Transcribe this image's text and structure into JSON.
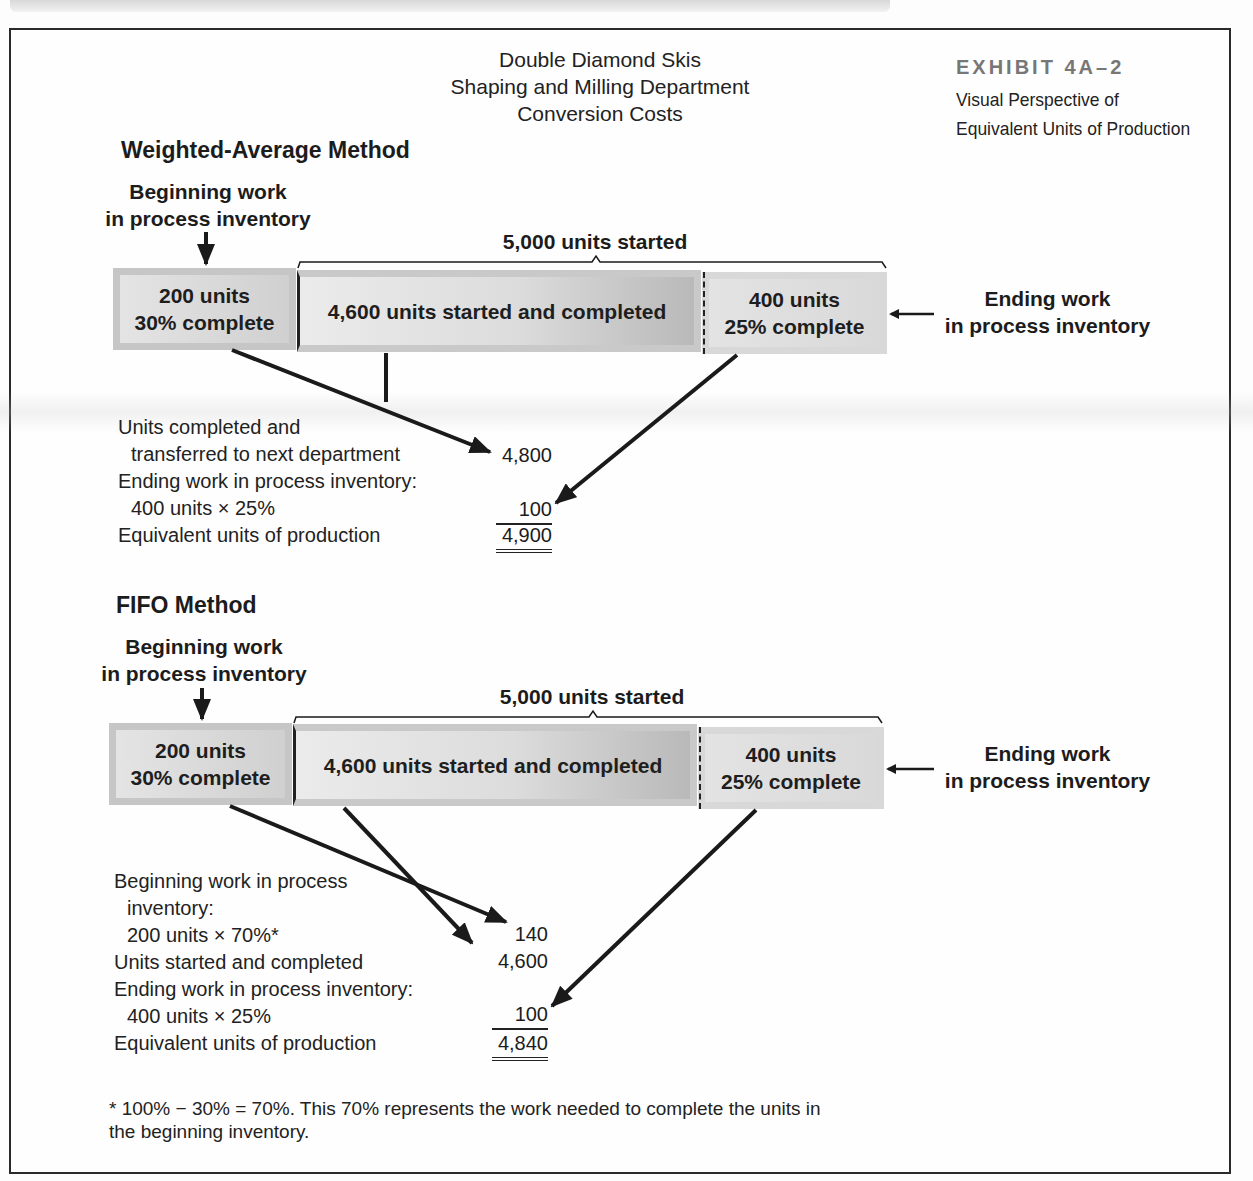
{
  "header": {
    "title_lines": [
      "Double Diamond Skis",
      "Shaping and Milling Department",
      "Conversion Costs"
    ],
    "exhibit_number": "EXHIBIT 4A–2",
    "exhibit_caption_lines": [
      "Visual Perspective of",
      "Equivalent Units of Production"
    ]
  },
  "weighted_average": {
    "title": "Weighted-Average Method",
    "beginning_label_lines": [
      "Beginning work",
      "in process inventory"
    ],
    "started_label": "5,000 units started",
    "ending_label_lines": [
      "Ending work",
      "in process inventory"
    ],
    "boxes": {
      "beginning": [
        "200 units",
        "30% complete"
      ],
      "started_completed": "4,600 units started and completed",
      "ending": [
        "400 units",
        "25% complete"
      ]
    },
    "calc_rows": [
      {
        "label": "Units completed and",
        "value": ""
      },
      {
        "label": "  transferred to next department",
        "value": "4,800"
      },
      {
        "label": "Ending work in process inventory:",
        "value": ""
      },
      {
        "label": "  400 units × 25%",
        "value": "100"
      },
      {
        "label": "Equivalent units of production",
        "value": "4,900"
      }
    ]
  },
  "fifo": {
    "title": "FIFO Method",
    "beginning_label_lines": [
      "Beginning work",
      "in process inventory"
    ],
    "started_label": "5,000 units started",
    "ending_label_lines": [
      "Ending work",
      "in process inventory"
    ],
    "boxes": {
      "beginning": [
        "200 units",
        "30% complete"
      ],
      "started_completed": "4,600 units started and completed",
      "ending": [
        "400 units",
        "25% complete"
      ]
    },
    "calc_rows": [
      {
        "label": "Beginning work in process",
        "value": ""
      },
      {
        "label": "  inventory:",
        "value": ""
      },
      {
        "label": "  200 units × 70%*",
        "value": "140"
      },
      {
        "label": "Units started and completed",
        "value": "4,600"
      },
      {
        "label": "Ending work in process inventory:",
        "value": ""
      },
      {
        "label": "  400 units × 25%",
        "value": "100"
      },
      {
        "label": "Equivalent units of production",
        "value": "4,840"
      }
    ]
  },
  "footnote_lines": [
    "* 100% − 30% = 70%. This 70% represents the work needed to complete the units in",
    "the beginning inventory."
  ]
}
